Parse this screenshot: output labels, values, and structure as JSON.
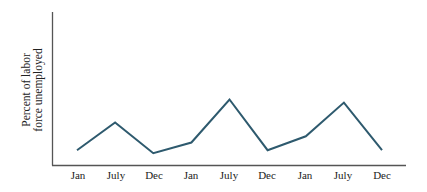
{
  "chart_data": {
    "type": "line",
    "title": "",
    "xlabel": "",
    "ylabel": "Percent of labor force unemployed",
    "ylabel_lines": [
      "Percent of labor",
      "force unemployed"
    ],
    "categories": [
      "Jan",
      "July",
      "Dec",
      "Jan",
      "July",
      "Dec",
      "Jan",
      "July",
      "Dec"
    ],
    "series": [
      {
        "name": "Unemployment",
        "values": [
          1.0,
          2.8,
          0.8,
          1.5,
          4.3,
          1.0,
          1.9,
          4.1,
          1.0
        ]
      }
    ],
    "ylim": [
      0,
      10
    ],
    "y_ticks_shown": false,
    "grid": false,
    "legend": "none",
    "line_color": "#2e5a6e",
    "axis_color": "#555555"
  }
}
